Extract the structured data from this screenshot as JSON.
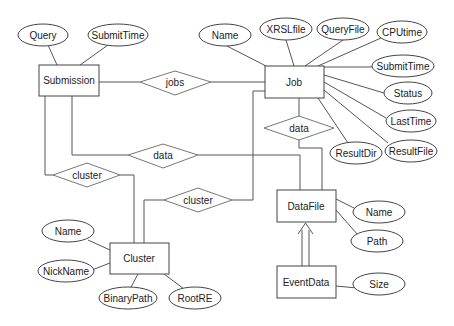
{
  "entities": {
    "submission": "Submission",
    "job": "Job",
    "cluster": "Cluster",
    "datafile": "DataFile",
    "eventdata": "EventData"
  },
  "relationships": {
    "jobs": "jobs",
    "data_job_datafile": "data",
    "data_submission_datafile": "data",
    "cluster_submission": "cluster",
    "cluster_job": "cluster"
  },
  "attributes": {
    "submission": [
      "Query",
      "SubmitTime"
    ],
    "job": [
      "Name",
      "XRSLfile",
      "QueryFile",
      "CPUtime",
      "SubmitTime",
      "Status",
      "LastTime",
      "ResultFile",
      "ResultDir"
    ],
    "cluster": [
      "Name",
      "NickName",
      "BinaryPath",
      "RootRE"
    ],
    "datafile": [
      "Name",
      "Path"
    ],
    "eventdata": [
      "Size"
    ]
  }
}
